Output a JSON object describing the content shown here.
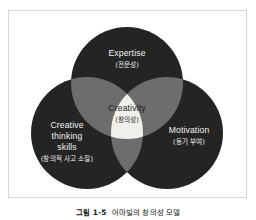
{
  "figure": {
    "caption_number": "그림 1-5",
    "caption_text": "아마빌의 창의성 모델",
    "colors": {
      "circle_dark": "#242424",
      "overlap_pair": "#6d6d6d",
      "overlap_center": "#f0efe9",
      "frame_border": "#d6d6d6",
      "page_background": "#ffffff",
      "label_on_dark": "#f2f2f0",
      "label_on_light": "#1f1f1f",
      "caption": "#161616"
    },
    "diagram": {
      "type": "venn",
      "set_count": 3,
      "sets": [
        {
          "id": "expertise",
          "position": "top",
          "title_en": "Expertise",
          "title_ko": "(전문성)",
          "title_en_lines": [
            "Expertise"
          ],
          "cx": 128,
          "cy": 78,
          "r": 60
        },
        {
          "id": "creative-thinking-skills",
          "position": "bottom-left",
          "title_en": "Creative thinking skills",
          "title_ko": "(창의적 사고 소질)",
          "title_en_lines": [
            "Creative",
            "thinking",
            "skills"
          ],
          "cx": 86,
          "cy": 124,
          "r": 60
        },
        {
          "id": "motivation",
          "position": "bottom-right",
          "title_en": "Motivation",
          "title_ko": "(동기 부여)",
          "title_en_lines": [
            "Motivation"
          ],
          "cx": 170,
          "cy": 124,
          "r": 60
        }
      ],
      "intersection": {
        "id": "creativity",
        "title_en": "Creativity",
        "title_ko": "(창의성)"
      }
    }
  }
}
